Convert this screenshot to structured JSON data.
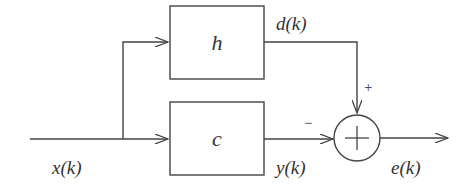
{
  "diagram": {
    "colors": {
      "stroke": "#444444",
      "text": "#333333",
      "background": "#ffffff"
    },
    "blocks": [
      {
        "id": "h",
        "label": "h"
      },
      {
        "id": "c",
        "label": "c"
      }
    ],
    "summing_junction": {
      "symbol": "+",
      "plus_sign": "+",
      "minus_sign": "−"
    },
    "signals": {
      "input": "x(k)",
      "desired": "d(k)",
      "output": "y(k)",
      "error": "e(k)"
    },
    "edges": [
      {
        "from": "x(k)",
        "to": "h"
      },
      {
        "from": "x(k)",
        "to": "c"
      },
      {
        "from": "h",
        "to": "sum",
        "label": "d(k)",
        "sign": "+"
      },
      {
        "from": "c",
        "to": "sum",
        "label": "y(k)",
        "sign": "−"
      },
      {
        "from": "sum",
        "to": "output",
        "label": "e(k)"
      }
    ]
  }
}
